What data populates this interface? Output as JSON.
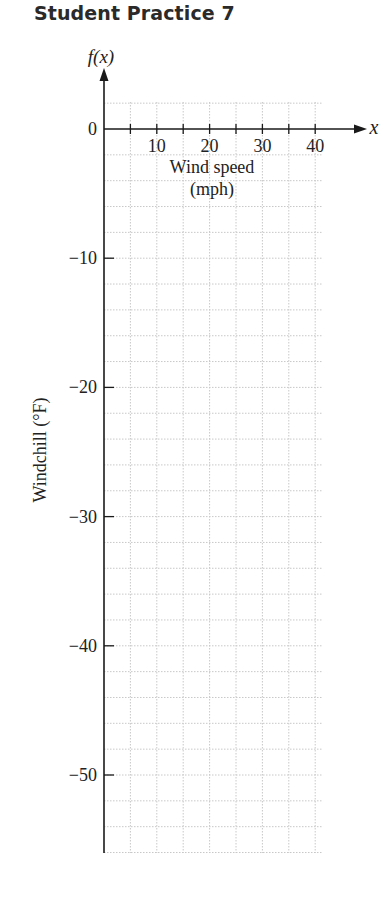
{
  "header": {
    "title": "Student Practice 7"
  },
  "chart_data": {
    "type": "line",
    "title": "Student Practice 7",
    "xlabel": "Wind speed (mph)",
    "xlabel_line1": "Wind speed",
    "xlabel_line2": "(mph)",
    "ylabel": "Windchill (°F)",
    "x_axis_symbol": "x",
    "y_axis_symbol": "f(x)",
    "xlim": [
      0,
      40
    ],
    "ylim": [
      -55,
      5
    ],
    "x_ticks": [
      5,
      10,
      15,
      20,
      25,
      30,
      35,
      40
    ],
    "x_tick_labels": [
      "10",
      "20",
      "30",
      "40"
    ],
    "x_tick_label_values": [
      10,
      20,
      30,
      40
    ],
    "y_ticks": [
      0,
      -10,
      -20,
      -30,
      -40,
      -50
    ],
    "y_tick_labels": [
      "0",
      "−10",
      "−20",
      "−30",
      "−40",
      "−50"
    ],
    "grid": true,
    "grid_x_step": 5,
    "grid_y_step": 2,
    "series": [],
    "note": "Blank coordinate grid for student to plot windchill vs wind speed"
  },
  "colors": {
    "axis": "#1a1a1a",
    "grid": "#c8c8c8",
    "text": "#222222"
  }
}
